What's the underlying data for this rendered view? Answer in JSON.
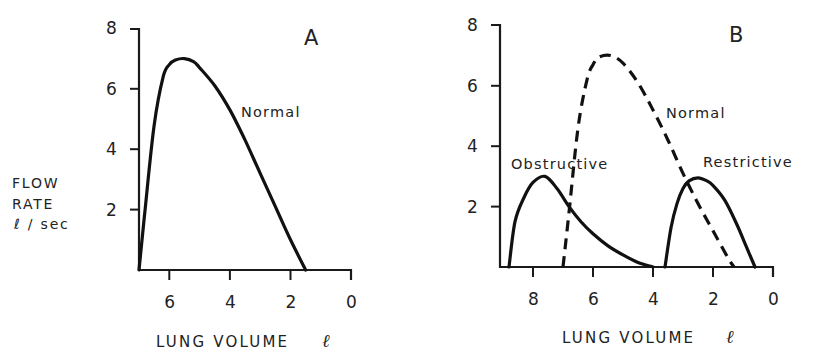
{
  "figure": {
    "ylabel_lines": [
      "FLOW",
      "RATE",
      "ℓ / sec"
    ],
    "panels": [
      {
        "letter": "A",
        "xlabel": "LUNG VOLUME",
        "xunit": "ℓ",
        "yticks": [
          "2",
          "4",
          "6",
          "8"
        ],
        "xticks": [
          "6",
          "4",
          "2",
          "0"
        ],
        "annotations": [
          {
            "text": "Normal"
          }
        ]
      },
      {
        "letter": "B",
        "xlabel": "LUNG VOLUME",
        "xunit": "ℓ",
        "yticks": [
          "2",
          "4",
          "6",
          "8"
        ],
        "xticks": [
          "8",
          "6",
          "4",
          "2",
          "0"
        ],
        "annotations": [
          {
            "text": "Normal"
          },
          {
            "text": "Obstructive"
          },
          {
            "text": "Restrictive"
          }
        ]
      }
    ]
  },
  "chart_data": [
    {
      "type": "line",
      "panel": "A",
      "title": "A",
      "xlabel": "LUNG VOLUME ℓ",
      "ylabel": "FLOW RATE ℓ / sec",
      "xlim": [
        7.0,
        0
      ],
      "ylim": [
        0,
        8
      ],
      "x_reversed": true,
      "xticks": [
        6,
        4,
        2,
        0
      ],
      "yticks": [
        2,
        4,
        6,
        8
      ],
      "grid": false,
      "legend": "none (inline label)",
      "series": [
        {
          "name": "Normal",
          "style": "solid",
          "x": [
            7.0,
            6.8,
            6.5,
            6.2,
            6.0,
            5.8,
            5.5,
            5.2,
            5.0,
            4.5,
            4.0,
            3.5,
            3.0,
            2.5,
            2.0,
            1.5
          ],
          "y": [
            0.0,
            2.0,
            4.8,
            6.4,
            6.8,
            6.95,
            7.0,
            6.9,
            6.7,
            6.1,
            5.3,
            4.3,
            3.2,
            2.1,
            1.0,
            0.0
          ]
        }
      ]
    },
    {
      "type": "line",
      "panel": "B",
      "title": "B",
      "xlabel": "LUNG VOLUME ℓ",
      "ylabel": "FLOW RATE ℓ / sec",
      "xlim": [
        9.1,
        0
      ],
      "ylim": [
        0,
        8
      ],
      "x_reversed": true,
      "xticks": [
        8,
        6,
        4,
        2,
        0
      ],
      "yticks": [
        2,
        4,
        6,
        8
      ],
      "grid": false,
      "legend": "none (inline labels)",
      "series": [
        {
          "name": "Normal",
          "style": "dashed",
          "x": [
            7.0,
            6.8,
            6.5,
            6.2,
            6.0,
            5.8,
            5.4,
            5.0,
            4.5,
            4.0,
            3.5,
            3.0,
            2.5,
            2.0,
            1.5,
            1.3
          ],
          "y": [
            0.0,
            1.8,
            4.6,
            6.2,
            6.7,
            6.95,
            7.0,
            6.75,
            6.1,
            5.2,
            4.2,
            3.1,
            2.1,
            1.2,
            0.3,
            0.0
          ]
        },
        {
          "name": "Obstructive",
          "style": "solid",
          "x": [
            8.8,
            8.6,
            8.3,
            8.0,
            7.6,
            7.2,
            6.8,
            6.4,
            6.0,
            5.5,
            5.0,
            4.5,
            4.0
          ],
          "y": [
            0.0,
            1.5,
            2.3,
            2.8,
            3.0,
            2.6,
            2.0,
            1.5,
            1.1,
            0.7,
            0.4,
            0.15,
            0.0
          ]
        },
        {
          "name": "Restrictive",
          "style": "solid",
          "x": [
            3.6,
            3.4,
            3.2,
            3.0,
            2.8,
            2.5,
            2.2,
            2.0,
            1.6,
            1.2,
            0.9,
            0.6
          ],
          "y": [
            0.0,
            1.3,
            2.1,
            2.6,
            2.85,
            2.95,
            2.85,
            2.7,
            2.2,
            1.4,
            0.7,
            0.0
          ]
        }
      ]
    }
  ]
}
